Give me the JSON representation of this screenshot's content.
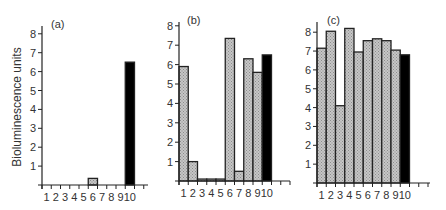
{
  "figure": {
    "ylabel": "Bioluminescence units",
    "colors": {
      "axis": "#222222",
      "hatched_fill": "#c6c6c6",
      "hatch_dot": "#8c8c8c",
      "control_fill": "#000000",
      "outline": "#222222",
      "text": "#333333"
    }
  },
  "chart_data": [
    {
      "type": "bar",
      "title": "(a)",
      "xlabel": "",
      "ylabel": "Bioluminescence units",
      "categories": [
        "1",
        "2",
        "3",
        "4",
        "5",
        "6",
        "7",
        "8",
        "9",
        "10"
      ],
      "values": [
        0,
        0,
        0,
        0,
        0,
        0.35,
        0,
        0,
        0,
        6.5
      ],
      "bar_styles": [
        "hatched",
        "hatched",
        "hatched",
        "hatched",
        "hatched",
        "hatched",
        "hatched",
        "hatched",
        "hatched",
        "solid"
      ],
      "yticks": [
        1,
        2,
        3,
        4,
        5,
        6,
        7,
        8
      ],
      "ylim": [
        0,
        8.3
      ],
      "grid": false
    },
    {
      "type": "bar",
      "title": "(b)",
      "xlabel": "",
      "ylabel": "",
      "categories": [
        "1",
        "2",
        "3",
        "4",
        "5",
        "6",
        "7",
        "8",
        "9",
        "10"
      ],
      "values": [
        5.9,
        1.0,
        0.1,
        0.1,
        0.1,
        7.35,
        0.5,
        6.3,
        5.6,
        6.5
      ],
      "bar_styles": [
        "hatched",
        "hatched",
        "hatched",
        "hatched",
        "hatched",
        "hatched",
        "hatched",
        "hatched",
        "hatched",
        "solid"
      ],
      "yticks": [
        1,
        2,
        3,
        4,
        5,
        6,
        7,
        8
      ],
      "ylim": [
        0,
        8.3
      ],
      "grid": false
    },
    {
      "type": "bar",
      "title": "(c)",
      "xlabel": "",
      "ylabel": "",
      "categories": [
        "1",
        "2",
        "3",
        "4",
        "5",
        "6",
        "7",
        "8",
        "9",
        "10"
      ],
      "values": [
        7.15,
        8.05,
        4.1,
        8.2,
        6.95,
        7.55,
        7.65,
        7.55,
        7.05,
        6.8
      ],
      "bar_styles": [
        "hatched",
        "hatched",
        "hatched",
        "hatched",
        "hatched",
        "hatched",
        "hatched",
        "hatched",
        "hatched",
        "solid"
      ],
      "yticks": [
        1,
        2,
        3,
        4,
        5,
        6,
        7,
        8
      ],
      "ylim": [
        0,
        8.3
      ],
      "grid": false
    }
  ],
  "layout": {
    "panels": [
      {
        "axis_x": 42,
        "base_y": 185,
        "unit_px": 18.9,
        "bar_w": 9.25,
        "x_end": 148,
        "axis_top": 26,
        "label_x": 51,
        "label_y": 28
      },
      {
        "axis_x": 179,
        "base_y": 181,
        "unit_px": 19.4,
        "bar_w": 9.25,
        "x_end": 290,
        "axis_top": 22,
        "label_x": 187,
        "label_y": 24
      },
      {
        "axis_x": 317,
        "base_y": 183,
        "unit_px": 18.85,
        "bar_w": 9.25,
        "x_end": 430,
        "axis_top": 22,
        "label_x": 327,
        "label_y": 24
      }
    ]
  }
}
